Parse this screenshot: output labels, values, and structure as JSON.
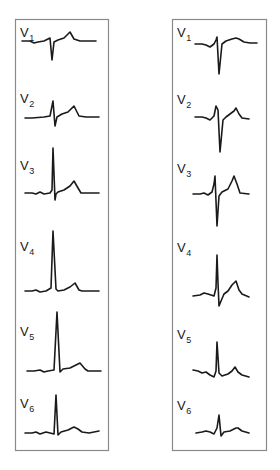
{
  "figure": {
    "ink_color": "#1a1a1a",
    "frame_color": "#8a8a8a",
    "background_color": "#ffffff"
  },
  "panels": [
    {
      "name": "left",
      "pattern": "normal R-wave progression",
      "leads": [
        {
          "prefix": "V",
          "sub": "1"
        },
        {
          "prefix": "V",
          "sub": "2"
        },
        {
          "prefix": "V",
          "sub": "3"
        },
        {
          "prefix": "V",
          "sub": "4"
        },
        {
          "prefix": "V",
          "sub": "5"
        },
        {
          "prefix": "V",
          "sub": "6"
        }
      ]
    },
    {
      "name": "right",
      "pattern": "delayed R-wave progression with persistent deep S waves",
      "leads": [
        {
          "prefix": "V",
          "sub": "1"
        },
        {
          "prefix": "V",
          "sub": "2"
        },
        {
          "prefix": "V",
          "sub": "3"
        },
        {
          "prefix": "V",
          "sub": "4"
        },
        {
          "prefix": "V",
          "sub": "5"
        },
        {
          "prefix": "V",
          "sub": "6"
        }
      ]
    }
  ]
}
